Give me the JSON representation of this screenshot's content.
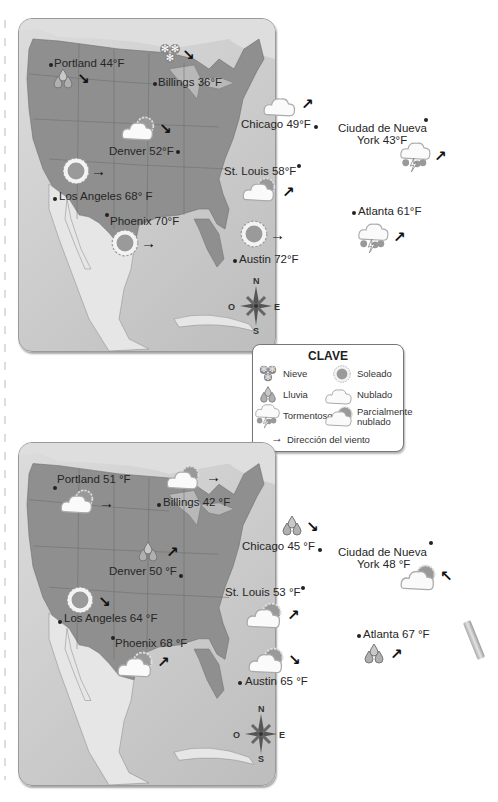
{
  "legend": {
    "title": "CLAVE",
    "items": [
      {
        "icon": "snow-icon",
        "label": "Nieve"
      },
      {
        "icon": "sun-icon",
        "label": "Soleado"
      },
      {
        "icon": "rain-icon",
        "label": "Lluvia"
      },
      {
        "icon": "cloud-icon",
        "label": "Nublado"
      },
      {
        "icon": "storm-icon",
        "label": "Tormentoso"
      },
      {
        "icon": "partly-cloudy-icon",
        "label": "Parcialmente nublado"
      }
    ],
    "wind_label": "Dirección del viento",
    "wind_arrow": "→"
  },
  "compass": {
    "n": "N",
    "s": "S",
    "e": "E",
    "w": "O"
  },
  "maps": [
    {
      "cities": [
        {
          "name": "Portland",
          "temp": "Portland 44°F",
          "weather": "rain",
          "wind": "↘"
        },
        {
          "name": "Billings",
          "temp": "Billings 36°F",
          "weather": "snow",
          "wind": "↘"
        },
        {
          "name": "Denver",
          "temp": "Denver 52°F",
          "weather": "partly-cloudy",
          "wind": "↘"
        },
        {
          "name": "Chicago",
          "temp": "Chicago 49°F",
          "weather": "cloudy",
          "wind": "↗"
        },
        {
          "name": "New York",
          "temp_line1": "Ciudad de Nueva",
          "temp_line2": "York 43°F",
          "weather": "storm",
          "wind": "↗"
        },
        {
          "name": "Los Angeles",
          "temp": "Los Angeles 68° F",
          "weather": "sunny",
          "wind": "→"
        },
        {
          "name": "St. Louis",
          "temp": "St. Louis 58°F",
          "weather": "partly-cloudy",
          "wind": "↗"
        },
        {
          "name": "Phoenix",
          "temp": "Phoenix 70°F",
          "weather": "sunny",
          "wind": "→"
        },
        {
          "name": "Austin",
          "temp": "Austin 72°F",
          "weather": "sunny",
          "wind": "→"
        },
        {
          "name": "Atlanta",
          "temp": "Atlanta 61°F",
          "weather": "storm",
          "wind": "↗"
        }
      ]
    },
    {
      "cities": [
        {
          "name": "Portland",
          "temp": "Portland 51 °F",
          "weather": "partly-cloudy",
          "wind": "→"
        },
        {
          "name": "Billings",
          "temp": "Billings 42 °F",
          "weather": "partly-cloudy",
          "wind": "→"
        },
        {
          "name": "Denver",
          "temp": "Denver 50 °F",
          "weather": "rain",
          "wind": "↗"
        },
        {
          "name": "Chicago",
          "temp": "Chicago 45 °F",
          "weather": "rain",
          "wind": "↘"
        },
        {
          "name": "New York",
          "temp_line1": "Ciudad de Nueva",
          "temp_line2": "York 48 °F",
          "weather": "partly-cloudy",
          "wind": "↖"
        },
        {
          "name": "Los Angeles",
          "temp": "Los Angeles 64 °F",
          "weather": "sunny",
          "wind": "↘"
        },
        {
          "name": "St. Louis",
          "temp": "St. Louis 53 °F",
          "weather": "partly-cloudy",
          "wind": "↗"
        },
        {
          "name": "Phoenix",
          "temp": "Phoenix 68 °F",
          "weather": "partly-cloudy",
          "wind": "↗"
        },
        {
          "name": "Austin",
          "temp": "Austin 65 °F",
          "weather": "partly-cloudy",
          "wind": "↘"
        },
        {
          "name": "Atlanta",
          "temp": "Atlanta 67 °F",
          "weather": "rain",
          "wind": "↗"
        }
      ]
    }
  ],
  "colors": {
    "land": "#8f8f8f",
    "water": "#cfcfcf",
    "foreign_land": "#e4e4e4",
    "text": "#262626"
  }
}
